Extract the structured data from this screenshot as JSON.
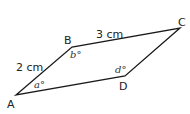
{
  "diagram": {
    "type": "parallelogram",
    "vertices": {
      "A": {
        "label": "A",
        "x": 16,
        "y": 95
      },
      "B": {
        "label": "B",
        "x": 72,
        "y": 47
      },
      "C": {
        "label": "C",
        "x": 180,
        "y": 28
      },
      "D": {
        "label": "D",
        "x": 125,
        "y": 76
      }
    },
    "sides": {
      "AB": {
        "label": "2 cm"
      },
      "BC": {
        "label": "3 cm"
      }
    },
    "angles": {
      "a": {
        "label": "a°",
        "var": "a",
        "at": "A"
      },
      "b": {
        "label": "b°",
        "var": "b",
        "at": "B"
      },
      "d": {
        "label": "d°",
        "var": "d",
        "at": "D"
      }
    },
    "stroke_color": "#1a1a1a",
    "text_color": "#222222"
  }
}
